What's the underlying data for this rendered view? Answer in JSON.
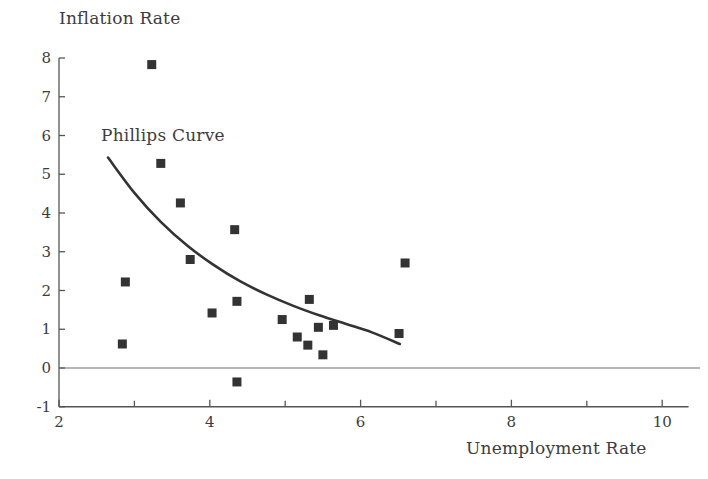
{
  "chart_data": {
    "type": "scatter",
    "title": "",
    "xlabel": "Unemployment Rate",
    "ylabel": "Inflation Rate",
    "xlim": [
      2,
      10.35
    ],
    "ylim": [
      -1,
      8.2
    ],
    "xticks": [
      2,
      4,
      6,
      8,
      10
    ],
    "xtick_labels": [
      "2",
      "4",
      "6",
      "8",
      "10"
    ],
    "xminor_ticks": [
      3,
      5,
      7,
      9
    ],
    "yticks": [
      -1,
      0,
      1,
      2,
      3,
      4,
      5,
      6,
      7,
      8
    ],
    "ytick_labels": [
      "-1",
      "0",
      "1",
      "2",
      "3",
      "4",
      "5",
      "6",
      "7",
      "8"
    ],
    "grid": false,
    "legend": false,
    "zero_line": 0,
    "marker": "square",
    "marker_color": "#333333",
    "marker_size": 9,
    "points": [
      {
        "x": 3.23,
        "y": 7.83
      },
      {
        "x": 3.35,
        "y": 5.28
      },
      {
        "x": 3.61,
        "y": 4.26
      },
      {
        "x": 3.74,
        "y": 2.8
      },
      {
        "x": 4.33,
        "y": 3.57
      },
      {
        "x": 2.88,
        "y": 2.22
      },
      {
        "x": 2.84,
        "y": 0.62
      },
      {
        "x": 4.03,
        "y": 1.42
      },
      {
        "x": 4.36,
        "y": 1.72
      },
      {
        "x": 4.36,
        "y": -0.36
      },
      {
        "x": 4.96,
        "y": 1.25
      },
      {
        "x": 5.16,
        "y": 0.8
      },
      {
        "x": 5.3,
        "y": 0.59
      },
      {
        "x": 5.32,
        "y": 1.77
      },
      {
        "x": 5.44,
        "y": 1.05
      },
      {
        "x": 5.5,
        "y": 0.34
      },
      {
        "x": 5.64,
        "y": 1.1
      },
      {
        "x": 6.59,
        "y": 2.71
      },
      {
        "x": 6.51,
        "y": 0.89
      }
    ],
    "fitted_curve": {
      "label": "Phillips Curve",
      "color": "#333333",
      "line_width": 2.6,
      "x_start": 2.65,
      "x_end": 6.52,
      "points": [
        {
          "x": 2.65,
          "y": 5.43
        },
        {
          "x": 3.0,
          "y": 4.52
        },
        {
          "x": 3.35,
          "y": 3.77
        },
        {
          "x": 3.7,
          "y": 3.16
        },
        {
          "x": 4.05,
          "y": 2.66
        },
        {
          "x": 4.4,
          "y": 2.24
        },
        {
          "x": 4.75,
          "y": 1.9
        },
        {
          "x": 5.1,
          "y": 1.61
        },
        {
          "x": 5.45,
          "y": 1.36
        },
        {
          "x": 5.8,
          "y": 1.14
        },
        {
          "x": 6.15,
          "y": 0.92
        },
        {
          "x": 6.52,
          "y": 0.62
        }
      ]
    },
    "annotations": [
      {
        "text": "Phillips Curve",
        "x": 2.7,
        "y": 5.95
      }
    ]
  },
  "axis": {
    "y_title": "Inflation Rate",
    "x_title": "Unemployment Rate",
    "curve_label": "Phillips Curve"
  },
  "colors": {
    "marker": "#333333",
    "curve": "#333333",
    "axis": "#555555",
    "zero_line": "#6b6b6b",
    "text": "#3d3d3d",
    "background": "#ffffff"
  }
}
